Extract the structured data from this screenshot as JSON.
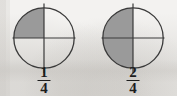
{
  "diagram": {
    "background_color": "#f3f2f0",
    "ink_color": "#1d1d1d",
    "shade_color": "#9a9a9a",
    "figures": [
      {
        "id": "fraction-circle-one-quarter",
        "numerator": "1",
        "denominator": "4",
        "fraction_text": "1/4",
        "total_parts": 4,
        "shaded_parts": 1,
        "shaded_quadrants": [
          "upper-left"
        ],
        "shade_color": "#9a9a9a",
        "outline_color": "#3a3a3a"
      },
      {
        "id": "fraction-circle-two-quarters",
        "numerator": "2",
        "denominator": "4",
        "fraction_text": "2/4",
        "total_parts": 4,
        "shaded_parts": 2,
        "shaded_quadrants": [
          "upper-left",
          "lower-left"
        ],
        "shade_color": "#9a9a9a",
        "outline_color": "#3a3a3a"
      }
    ]
  }
}
